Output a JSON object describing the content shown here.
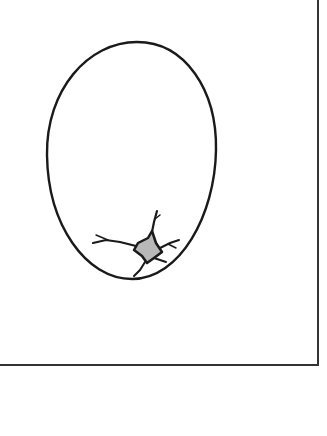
{
  "figure": {
    "colors": {
      "background": "#ffffff",
      "stroke": "#1a1a1a",
      "crack_fill": "#b8b8b8",
      "frame": "#333333"
    },
    "frame": {
      "right_x": 318,
      "bottom_y": 365
    },
    "egg": {
      "top_y": 42,
      "bottom_y": 279,
      "left_x": 47,
      "right_x": 216,
      "center_x": 132
    },
    "crack": {
      "center_x": 145,
      "center_y": 250
    }
  }
}
